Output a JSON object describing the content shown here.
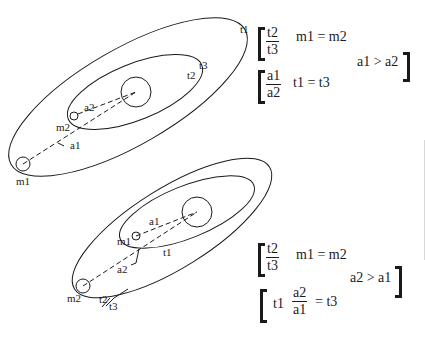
{
  "top_diagram": {
    "labels": {
      "t1": "t1",
      "t2": "t2",
      "t3": "t3",
      "a1": "a1",
      "a2": "a2",
      "m1": "m1",
      "m2": "m2"
    },
    "equations": {
      "eq1": {
        "num": "t2",
        "den": "t3",
        "rhs": "m1 = m2"
      },
      "eq2": {
        "num": "a1",
        "den": "a2",
        "rhs": "t1 = t3"
      },
      "condition": "a1 > a2"
    }
  },
  "bottom_diagram": {
    "labels": {
      "t1": "t1",
      "t2_t3": "t2",
      "t3": "t3",
      "a1": "a1",
      "a2": "a2",
      "m1": "m1",
      "m2": "m2"
    },
    "equations": {
      "eq1": {
        "num": "t2",
        "den": "t3",
        "rhs": "m1 = m2"
      },
      "eq2": {
        "lhs": "t1",
        "num": "a2",
        "den": "a1",
        "rhs": "= t3"
      },
      "condition": "a2 > a1"
    }
  },
  "colors": {
    "line": "#1a1a1a",
    "background": "#ffffff"
  }
}
